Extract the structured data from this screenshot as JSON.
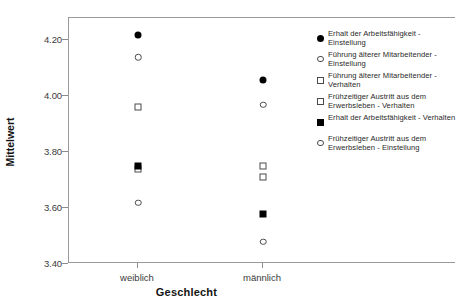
{
  "chart_data": {
    "type": "scatter",
    "title": "",
    "xlabel": "Geschlecht",
    "ylabel": "Mittelwert",
    "categories": [
      "weiblich",
      "männlich"
    ],
    "ylim": [
      3.4,
      4.28
    ],
    "yticks": [
      "3.40",
      "3.60",
      "3.80",
      "4.00",
      "4.20"
    ],
    "ytick_values": [
      3.4,
      3.6,
      3.8,
      4.0,
      4.2
    ],
    "grid": false,
    "legend_position": "right",
    "series": [
      {
        "name": "Erhalt der Arbeitsfähigkeit - Einstellung",
        "marker": "circle-filled",
        "values": [
          4.22,
          4.06
        ]
      },
      {
        "name": "Führung älterer Mitarbeitender - Einstellung",
        "marker": "circle-open",
        "values": [
          4.14,
          3.97
        ]
      },
      {
        "name": "Führung älterer Mitarbeitender - Verhalten",
        "marker": "square-open",
        "values": [
          3.96,
          3.75
        ]
      },
      {
        "name": "Frühzeitiger Austritt aus dem Erwerbsleben - Verhalten",
        "marker": "square-open",
        "values": [
          3.74,
          3.71
        ]
      },
      {
        "name": "Erhalt der Arbeitsfähigkeit - Verhalten",
        "marker": "square-filled",
        "values": [
          3.75,
          3.58
        ]
      },
      {
        "name": "Frühzeitiger Austritt aus dem Erwerbsleben - Einstellung",
        "marker": "circle-open",
        "values": [
          3.62,
          3.48
        ]
      }
    ]
  },
  "legend": {
    "items": [
      {
        "marker": "circle-filled",
        "label": "Erhalt der Arbeitsfähigkeit - Einstellung"
      },
      {
        "marker": "circle-open",
        "label": "Führung älterer Mitarbeitender - Einstellung"
      },
      {
        "marker": "square-open",
        "label": "Führung älterer Mitarbeitender - Verhalten"
      },
      {
        "marker": "square-open",
        "label": "Frühzeitiger Austritt aus dem Erwerbsleben - Verhalten"
      },
      {
        "marker": "square-filled",
        "label": "Erhalt der Arbeitsfähigkeit - Verhalten"
      },
      {
        "marker": "circle-open",
        "label": "Frühzeitiger Austritt aus dem Erwerbsleben - Einstellung"
      }
    ]
  },
  "colors": {
    "marker_fill": "#000000",
    "marker_stroke": "#4a4a4a",
    "axis": "#9a9a9a",
    "text": "#2a2a2a",
    "background": "#ffffff"
  }
}
